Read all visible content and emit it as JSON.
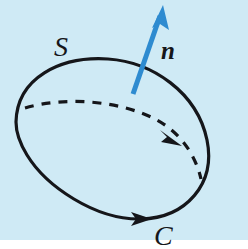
{
  "figure": {
    "kind": "stokes-theorem-surface-diagram",
    "background_color": "#cfeaf5",
    "ink_color": "#15161a",
    "normal_vector_color": "#2e8bd0",
    "width": 248,
    "height": 240
  },
  "labels": {
    "surface": "S",
    "normal": "n",
    "boundary_curve": "C"
  },
  "geometry": {
    "boundary_curve": {
      "name": "C",
      "style": "solid",
      "stroke_width": 3.2,
      "orientation": "counterclockwise-viewed-from-normal",
      "path": "M 16 122 C 17 78 60 56 108 59 C 152 62 197 92 207 140 C 216 184 186 218 141 219 C 95 220 46 186 27 155 C 19 142 16 132 16 122 Z",
      "arrow": {
        "x": 141,
        "y": 218,
        "angle_deg": 2
      }
    },
    "interior_dashed_curve": {
      "name": "equator-hidden-edge",
      "style": "dashed",
      "stroke_width": 3.2,
      "dash_pattern": "9 8",
      "path": "M 25 108 C 66 96 120 101 155 119 C 182 133 196 157 201 179",
      "arrow": {
        "x": 172,
        "y": 137,
        "angle_deg": 40
      }
    },
    "normal_vector": {
      "name": "n",
      "style": "solid",
      "stroke_width": 5,
      "color": "#2e8bd0",
      "tail": {
        "x": 133,
        "y": 94
      },
      "tip": {
        "x": 163,
        "y": 6
      }
    }
  }
}
